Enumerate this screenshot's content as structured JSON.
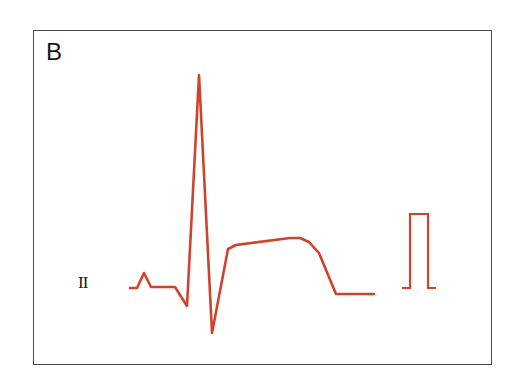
{
  "figure": {
    "panel_label": "B",
    "lead_label": "II",
    "trace_color": "#d0432b",
    "frame_color": "#4a4a4a"
  },
  "ecg": {
    "waveform_points": "130,288 137,288 144,273 151,287 175,287 187,306 199,75 212,333 228,249 236,245 290,238 300,238 309,242 319,253 336,294 374,294",
    "calibration_points": "402,288 410,288 410,214 428,214 428,288 436,288"
  }
}
